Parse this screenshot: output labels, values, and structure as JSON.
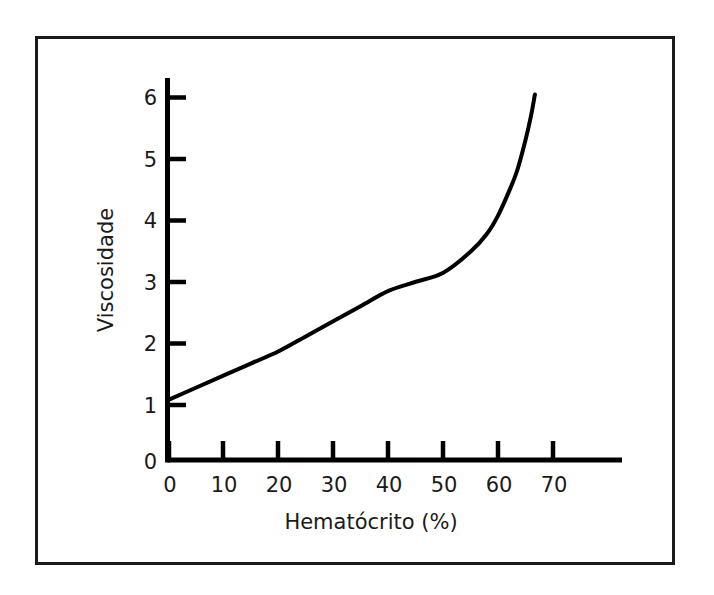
{
  "figure": {
    "background_color": "#ffffff",
    "frame_color": "#1a1a1a",
    "ink_color": "#000000"
  },
  "chart_data": {
    "type": "line",
    "title": "",
    "subtitle": "",
    "xlabel": "Hematócrito (%)",
    "ylabel": "Viscosidade",
    "xlim": [
      0,
      83
    ],
    "ylim": [
      0,
      6.8
    ],
    "xticks": [
      0,
      10,
      20,
      30,
      40,
      50,
      60,
      70
    ],
    "yticks": [
      0,
      1,
      2,
      3,
      4,
      5,
      6
    ],
    "xtick_labels": [
      "0",
      "10",
      "20",
      "30",
      "40",
      "50",
      "60",
      "70"
    ],
    "ytick_labels": [
      "0",
      "1",
      "2",
      "3",
      "4",
      "5",
      "6"
    ],
    "grid": false,
    "legend": null,
    "legend_position": "none",
    "annotations": [],
    "series": [
      {
        "name": "Viscosidade do sangue",
        "color": "#000000",
        "line_width": 4,
        "x": [
          0,
          5,
          10,
          15,
          20,
          25,
          30,
          35,
          40,
          45,
          50,
          55,
          58,
          60,
          62,
          63.5,
          65,
          66,
          66.7
        ],
        "y": [
          1.0,
          1.2,
          1.4,
          1.6,
          1.8,
          2.05,
          2.3,
          2.55,
          2.8,
          2.95,
          3.1,
          3.45,
          3.75,
          4.05,
          4.45,
          4.8,
          5.3,
          5.7,
          6.05
        ]
      }
    ]
  },
  "axis_x": {
    "label": "Hematócrito (%)",
    "tick_values": [
      "0",
      "10",
      "20",
      "30",
      "40",
      "50",
      "60",
      "70"
    ]
  },
  "axis_y": {
    "label": "Viscosidade",
    "tick_values": [
      "0",
      "1",
      "2",
      "3",
      "4",
      "5",
      "6"
    ]
  }
}
